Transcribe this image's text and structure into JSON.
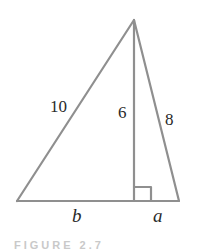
{
  "diagram": {
    "type": "triangle-with-altitude",
    "vertices": {
      "apex": [
        134,
        20
      ],
      "bottom_left": [
        17,
        201
      ],
      "foot": [
        134,
        201
      ],
      "bottom_right": [
        179,
        201
      ]
    },
    "labels": {
      "left_side": "10",
      "altitude": "6",
      "right_side": "8",
      "left_base_segment": "b",
      "right_base_segment": "a"
    },
    "right_angle_marker": true,
    "colors": {
      "line": "#8f8f8f",
      "text": "#2a2a2a",
      "background": "#ffffff"
    }
  },
  "caption": {
    "text": "FIGURE 2.7"
  }
}
